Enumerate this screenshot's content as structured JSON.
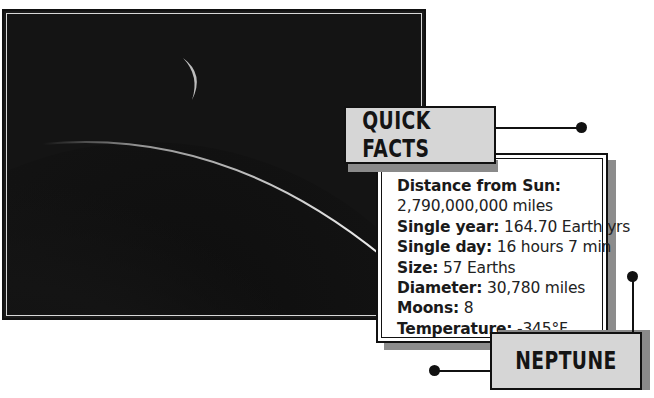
{
  "photo": {
    "subject": "Neptune crescent with moon",
    "icon": "planet-photo"
  },
  "quick_facts": {
    "title": "QUICK FACTS",
    "items": [
      {
        "label": "Distance from Sun:",
        "value": ""
      },
      {
        "label": "",
        "value": "2,790,000,000 miles"
      },
      {
        "label": "Single year:",
        "value": " 164.70 Earth yrs"
      },
      {
        "label": "Single day:",
        "value": " 16 hours 7 min"
      },
      {
        "label": "Size:",
        "value": " 57 Earths"
      },
      {
        "label": "Diameter:",
        "value": " 30,780 miles"
      },
      {
        "label": "Moons:",
        "value": " 8"
      },
      {
        "label": "Temperature:",
        "value": " -345°F"
      }
    ]
  },
  "planet_name": "NEPTUNE",
  "colors": {
    "tag_fill": "#d6d6d6",
    "shadow": "#8a8a8a",
    "outline": "#111111"
  }
}
